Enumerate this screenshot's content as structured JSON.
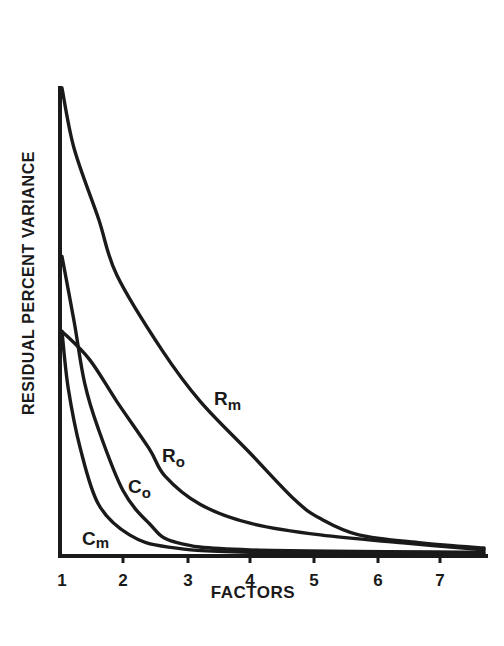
{
  "chart_data": {
    "type": "line",
    "title": "",
    "xlabel": "FACTORS",
    "ylabel": "RESIDUAL PERCENT VARIANCE",
    "x_ticks": [
      "1",
      "2",
      "3",
      "4",
      "5",
      "6",
      "7"
    ],
    "xlim": [
      1,
      7.7
    ],
    "ylim": [
      0,
      100
    ],
    "y_ticks": [],
    "grid": false,
    "legend": "inline labels on curves",
    "series": [
      {
        "name": "Rm",
        "label_main": "R",
        "label_sub": "m",
        "x": [
          1.0,
          1.2,
          1.6,
          1.9,
          2.6,
          3.2,
          4.0,
          4.7,
          5.1,
          5.7,
          6.7,
          7.7
        ],
        "values": [
          100,
          87,
          72,
          60,
          44,
          33,
          22,
          12,
          8,
          4.5,
          2.8,
          1.7
        ]
      },
      {
        "name": "Ro",
        "label_main": "R",
        "label_sub": "o",
        "x": [
          1.0,
          1.45,
          1.9,
          2.4,
          2.65,
          3.2,
          4.0,
          5.1,
          6.4,
          7.7
        ],
        "values": [
          48,
          42,
          33,
          23,
          17,
          11,
          7,
          4.5,
          2.8,
          1.3
        ]
      },
      {
        "name": "Co",
        "label_main": "C",
        "label_sub": "o",
        "x": [
          1.0,
          1.2,
          1.37,
          1.6,
          2.0,
          2.4,
          2.8,
          4.0,
          7.7
        ],
        "values": [
          64,
          50,
          37,
          27,
          14,
          7,
          3,
          1.3,
          0.8
        ]
      },
      {
        "name": "Cm",
        "label_main": "C",
        "label_sub": "m",
        "x": [
          1.0,
          1.1,
          1.3,
          1.6,
          2.1,
          2.7,
          4.0,
          7.7
        ],
        "values": [
          48,
          36,
          23,
          11,
          4.5,
          1.9,
          0.8,
          0.4
        ]
      }
    ]
  }
}
